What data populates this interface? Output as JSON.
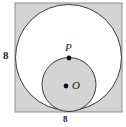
{
  "figure": {
    "type": "geometry-diagram",
    "background_color": "#ffffff",
    "square": {
      "name": "outer-square",
      "fill_color": "#d4d4d4",
      "stroke_color": "#8c8c8c",
      "x": 15,
      "y": 3,
      "width": 107,
      "height": 109,
      "side_label_left": "8",
      "side_label_bottom": "8"
    },
    "large_circle": {
      "name": "large-inscribed-circle",
      "fill_color": "#ffffff",
      "stroke_color": "#3a3a3a",
      "cx": 68.5,
      "cy": 57.5,
      "r": 53.5
    },
    "small_circle": {
      "name": "small-tangent-circle",
      "fill_color": "#d4d4d4",
      "stroke_color": "#3a3a3a",
      "cx": 69,
      "cy": 84.5,
      "r": 27
    },
    "points": [
      {
        "name": "point-p",
        "label": "P",
        "cx": 69,
        "cy": 58,
        "r": 2.4,
        "color": "#111111"
      },
      {
        "name": "point-o",
        "label": "O",
        "cx": 66,
        "cy": 86,
        "r": 2.4,
        "color": "#111111"
      }
    ]
  },
  "labels": {
    "side_left": "8",
    "side_bottom": "8",
    "point_p": "P",
    "point_o": "O"
  }
}
